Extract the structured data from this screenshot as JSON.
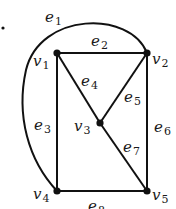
{
  "diagram": {
    "type": "graph",
    "colors": {
      "ink": "#111111",
      "background": "#ffffff"
    },
    "stray_dot": {
      "x": 3,
      "y": 28
    },
    "vertices": [
      {
        "id": "v1",
        "name": "v",
        "sub": "1",
        "x": 57,
        "y": 53,
        "label_x": 33,
        "label_y": 66
      },
      {
        "id": "v2",
        "name": "v",
        "sub": "2",
        "x": 147,
        "y": 53,
        "label_x": 152,
        "label_y": 64
      },
      {
        "id": "v3",
        "name": "v",
        "sub": "3",
        "x": 100,
        "y": 123,
        "label_x": 74,
        "label_y": 131
      },
      {
        "id": "v4",
        "name": "v",
        "sub": "4",
        "x": 57,
        "y": 191,
        "label_x": 33,
        "label_y": 199
      },
      {
        "id": "v5",
        "name": "v",
        "sub": "5",
        "x": 147,
        "y": 191,
        "label_x": 152,
        "label_y": 200
      }
    ],
    "edges": [
      {
        "id": "e1",
        "name": "e",
        "sub": "1",
        "from": "v2",
        "to": "v4",
        "curved": true,
        "label_x": 45,
        "label_y": 22
      },
      {
        "id": "e2",
        "name": "e",
        "sub": "2",
        "from": "v1",
        "to": "v2",
        "label_x": 91,
        "label_y": 46
      },
      {
        "id": "e3",
        "name": "e",
        "sub": "3",
        "from": "v1",
        "to": "v4",
        "label_x": 34,
        "label_y": 130
      },
      {
        "id": "e4",
        "name": "e",
        "sub": "4",
        "from": "v1",
        "to": "v3",
        "label_x": 81,
        "label_y": 86
      },
      {
        "id": "e5",
        "name": "e",
        "sub": "5",
        "from": "v2",
        "to": "v3",
        "label_x": 124,
        "label_y": 102
      },
      {
        "id": "e6",
        "name": "e",
        "sub": "6",
        "from": "v2",
        "to": "v5",
        "label_x": 154,
        "label_y": 132
      },
      {
        "id": "e7",
        "name": "e",
        "sub": "7",
        "from": "v3",
        "to": "v5",
        "label_x": 123,
        "label_y": 152
      },
      {
        "id": "e8",
        "name": "e",
        "sub": "8",
        "from": "v4",
        "to": "v5",
        "label_x": 88,
        "label_y": 211
      }
    ]
  }
}
